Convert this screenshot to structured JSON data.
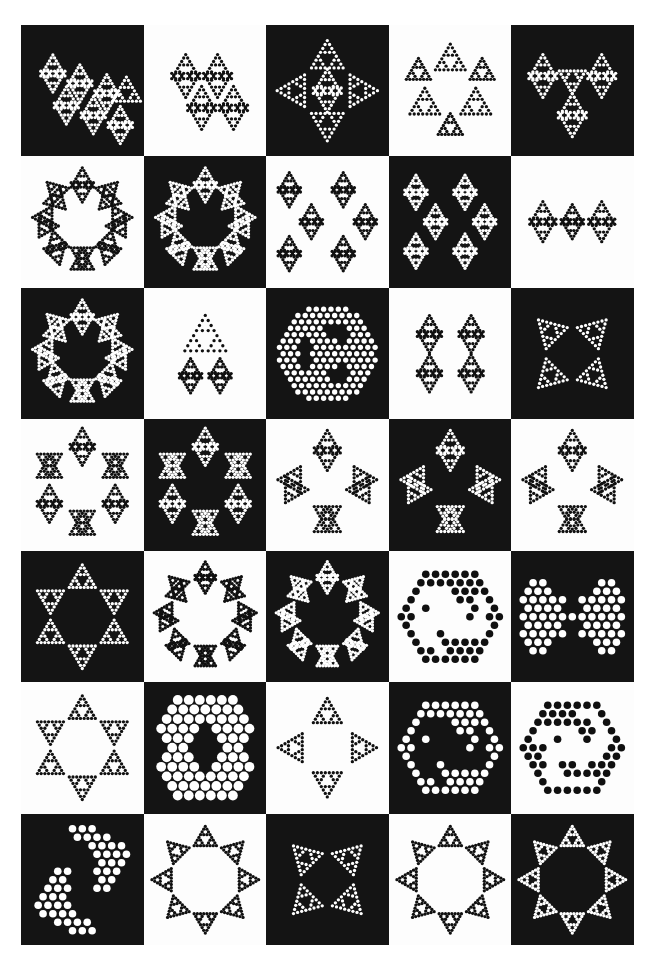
{
  "page": {
    "width": 654,
    "height": 969,
    "background_color": "#ffffff",
    "plate_black": "#141414",
    "plate_white": "#fdfdfd",
    "dot_light": "#ffffff",
    "dot_dark": "#101010",
    "grid": {
      "columns": 5,
      "rows": 7,
      "cell_count": 35
    }
  },
  "chart_data": {
    "type": "scatter",
    "xlabel": "",
    "ylabel": "",
    "grid": false,
    "legend": "none",
    "layout": {
      "columns": 5,
      "rows": 7
    },
    "checkerboard": "row-major alternating, row1 starts black",
    "cells": [
      {
        "index": 1,
        "row": 1,
        "col": 1,
        "bg": "black",
        "dot": "white",
        "motif": "sierpinski-rhombus-slab",
        "dot_size": "small",
        "seed_depth": 4
      },
      {
        "index": 2,
        "row": 1,
        "col": 2,
        "bg": "white",
        "dot": "black",
        "motif": "sierpinski-rhombus",
        "dot_size": "small",
        "seed_depth": 4
      },
      {
        "index": 3,
        "row": 1,
        "col": 3,
        "bg": "black",
        "dot": "white",
        "motif": "sierpinski-pinwheel-cross",
        "dot_size": "small",
        "seed_depth": 4
      },
      {
        "index": 4,
        "row": 1,
        "col": 4,
        "bg": "white",
        "dot": "black",
        "motif": "sierpinski-trefoil-crown",
        "dot_size": "small",
        "seed_depth": 4
      },
      {
        "index": 5,
        "row": 1,
        "col": 5,
        "bg": "black",
        "dot": "white",
        "motif": "sierpinski-tri-wing-fan",
        "dot_size": "small",
        "seed_depth": 4
      },
      {
        "index": 6,
        "row": 2,
        "col": 1,
        "bg": "white",
        "dot": "black",
        "motif": "sierpinski-octagonal-ring",
        "dot_size": "small",
        "seed_depth": 4
      },
      {
        "index": 7,
        "row": 2,
        "col": 2,
        "bg": "black",
        "dot": "white",
        "motif": "sierpinski-scalloped-ring",
        "dot_size": "small",
        "seed_depth": 4
      },
      {
        "index": 8,
        "row": 2,
        "col": 3,
        "bg": "white",
        "dot": "black",
        "motif": "sierpinski-double-s-wave",
        "dot_size": "small",
        "seed_depth": 4
      },
      {
        "index": 9,
        "row": 2,
        "col": 4,
        "bg": "black",
        "dot": "white",
        "motif": "sierpinski-twin-zigzag",
        "dot_size": "small",
        "seed_depth": 4
      },
      {
        "index": 10,
        "row": 2,
        "col": 5,
        "bg": "white",
        "dot": "black",
        "motif": "sierpinski-bowtie-chain",
        "dot_size": "small",
        "seed_depth": 4
      },
      {
        "index": 11,
        "row": 3,
        "col": 1,
        "bg": "black",
        "dot": "white",
        "motif": "sierpinski-annulus-wreath",
        "dot_size": "small",
        "seed_depth": 4
      },
      {
        "index": 12,
        "row": 3,
        "col": 2,
        "bg": "white",
        "dot": "black",
        "motif": "sierpinski-banner-shield",
        "dot_size": "small",
        "seed_depth": 4
      },
      {
        "index": 13,
        "row": 3,
        "col": 3,
        "bg": "black",
        "dot": "white",
        "motif": "sierpinski-hexagon-disc",
        "dot_size": "medium",
        "seed_depth": 3
      },
      {
        "index": 14,
        "row": 3,
        "col": 4,
        "bg": "white",
        "dot": "black",
        "motif": "sierpinski-double-rhombus-pair",
        "dot_size": "small",
        "seed_depth": 4
      },
      {
        "index": 15,
        "row": 3,
        "col": 5,
        "bg": "black",
        "dot": "white",
        "motif": "sierpinski-butterfly-x",
        "dot_size": "small",
        "seed_depth": 4
      },
      {
        "index": 16,
        "row": 4,
        "col": 1,
        "bg": "white",
        "dot": "black",
        "motif": "sierpinski-eight-wing-ring",
        "dot_size": "small",
        "seed_depth": 4
      },
      {
        "index": 17,
        "row": 4,
        "col": 2,
        "bg": "black",
        "dot": "white",
        "motif": "sierpinski-hex-lobe-ring",
        "dot_size": "small",
        "seed_depth": 4
      },
      {
        "index": 18,
        "row": 4,
        "col": 3,
        "bg": "white",
        "dot": "black",
        "motif": "sierpinski-pinwheel-four-blade",
        "dot_size": "small",
        "seed_depth": 4
      },
      {
        "index": 19,
        "row": 4,
        "col": 4,
        "bg": "black",
        "dot": "white",
        "motif": "sierpinski-square-lobe-ring",
        "dot_size": "small",
        "seed_depth": 4
      },
      {
        "index": 20,
        "row": 4,
        "col": 5,
        "bg": "white",
        "dot": "black",
        "motif": "sierpinski-diamond-lobe-ring",
        "dot_size": "small",
        "seed_depth": 4
      },
      {
        "index": 21,
        "row": 5,
        "col": 1,
        "bg": "black",
        "dot": "white",
        "motif": "sierpinski-star-outline-ring",
        "dot_size": "small",
        "seed_depth": 4
      },
      {
        "index": 22,
        "row": 5,
        "col": 2,
        "bg": "white",
        "dot": "black",
        "motif": "sierpinski-eight-petal-flower",
        "dot_size": "small",
        "seed_depth": 4
      },
      {
        "index": 23,
        "row": 5,
        "col": 3,
        "bg": "black",
        "dot": "white",
        "motif": "sierpinski-eight-petal-flower-inverted",
        "dot_size": "small",
        "seed_depth": 4
      },
      {
        "index": 24,
        "row": 5,
        "col": 4,
        "bg": "white",
        "dot": "black",
        "motif": "coarse-pinwheel-annulus",
        "dot_size": "large",
        "seed_depth": 2
      },
      {
        "index": 25,
        "row": 5,
        "col": 5,
        "bg": "black",
        "dot": "white",
        "motif": "coarse-butterfly",
        "dot_size": "large",
        "seed_depth": 2
      },
      {
        "index": 26,
        "row": 6,
        "col": 1,
        "bg": "white",
        "dot": "black",
        "motif": "sierpinski-six-point-star",
        "dot_size": "small",
        "seed_depth": 4
      },
      {
        "index": 27,
        "row": 6,
        "col": 2,
        "bg": "black",
        "dot": "white",
        "motif": "coarse-double-hourglass",
        "dot_size": "xlarge",
        "seed_depth": 2
      },
      {
        "index": 28,
        "row": 6,
        "col": 3,
        "bg": "white",
        "dot": "black",
        "motif": "sierpinski-triskelion-cross",
        "dot_size": "small",
        "seed_depth": 4
      },
      {
        "index": 29,
        "row": 6,
        "col": 4,
        "bg": "black",
        "dot": "white",
        "motif": "coarse-pinwheel-ring",
        "dot_size": "large",
        "seed_depth": 2
      },
      {
        "index": 30,
        "row": 6,
        "col": 5,
        "bg": "white",
        "dot": "black",
        "motif": "coarse-spiral-ring",
        "dot_size": "large",
        "seed_depth": 2
      },
      {
        "index": 31,
        "row": 7,
        "col": 1,
        "bg": "black",
        "dot": "white",
        "motif": "coarse-four-blade-pinwheel",
        "dot_size": "large",
        "seed_depth": 2
      },
      {
        "index": 32,
        "row": 7,
        "col": 2,
        "bg": "white",
        "dot": "black",
        "motif": "sierpinski-butterfly-wreath",
        "dot_size": "small",
        "seed_depth": 4
      },
      {
        "index": 33,
        "row": 7,
        "col": 3,
        "bg": "black",
        "dot": "white",
        "motif": "sierpinski-quad-butterfly",
        "dot_size": "small",
        "seed_depth": 4
      },
      {
        "index": 34,
        "row": 7,
        "col": 4,
        "bg": "white",
        "dot": "black",
        "motif": "sierpinski-winged-oval",
        "dot_size": "small",
        "seed_depth": 4
      },
      {
        "index": 35,
        "row": 7,
        "col": 5,
        "bg": "black",
        "dot": "white",
        "motif": "sierpinski-double-wing-band",
        "dot_size": "small",
        "seed_depth": 4
      }
    ]
  }
}
